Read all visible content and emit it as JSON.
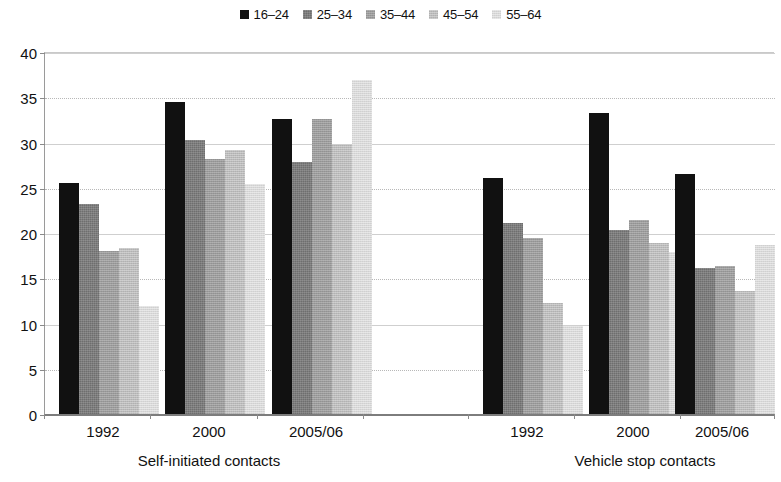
{
  "chart_data": {
    "type": "bar",
    "title": "",
    "subtitle": "",
    "xlabel": "",
    "ylabel": "",
    "ylim": [
      0,
      40
    ],
    "ytick_labels": [
      "0",
      "5",
      "10",
      "15",
      "20",
      "25",
      "30",
      "35",
      "40"
    ],
    "ytick_values": [
      0,
      5,
      10,
      15,
      20,
      25,
      30,
      35,
      40
    ],
    "grid": true,
    "legend_position": "top-center",
    "legend": [
      "16–24",
      "25–34",
      "35–44",
      "45–54",
      "55–64"
    ],
    "series": [
      {
        "name": "16–24",
        "color": "#111111",
        "values": [
          25.6,
          34.6,
          32.7,
          26.2,
          33.4,
          26.6
        ]
      },
      {
        "name": "25–34",
        "color": "#6e6e6e",
        "values": [
          23.3,
          30.4,
          28.0,
          21.2,
          20.4,
          16.3
        ]
      },
      {
        "name": "35–44",
        "color": "#9b9b9b",
        "values": [
          18.1,
          28.3,
          32.7,
          19.6,
          21.6,
          16.5
        ]
      },
      {
        "name": "45–54",
        "color": "#bbbbbb",
        "values": [
          18.4,
          29.3,
          29.8,
          12.4,
          19.0,
          13.7
        ]
      },
      {
        "name": "55–64",
        "color": "#d8d8d8",
        "values": [
          12.0,
          25.5,
          37.0,
          9.8,
          18.0,
          18.8
        ]
      }
    ],
    "categories": [
      "1992",
      "2000",
      "2005/06",
      "1992",
      "2000",
      "2005/06"
    ],
    "panels": [
      {
        "label": "Self-initiated contacts",
        "categories": [
          "1992",
          "2000",
          "2005/06"
        ]
      },
      {
        "label": "Vehicle stop contacts",
        "categories": [
          "1992",
          "2000",
          "2005/06"
        ]
      }
    ]
  },
  "axis": {
    "y_labels": [
      "40",
      "35",
      "30",
      "25",
      "20",
      "15",
      "10",
      "5",
      "0"
    ]
  },
  "panels": {
    "left": {
      "name": "Self-initiated contacts"
    },
    "right": {
      "name": "Vehicle stop contacts"
    }
  }
}
